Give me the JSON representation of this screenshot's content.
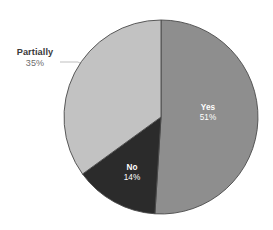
{
  "chart_data": {
    "type": "pie",
    "title": "",
    "subtitle": "",
    "xlabel": "",
    "ylabel": "",
    "grid": false,
    "legend_position": "none",
    "labels_on_slices": true,
    "start_angle_deg": 0,
    "direction": "clockwise",
    "categories": [
      "Yes",
      "Partially",
      "No"
    ],
    "values": [
      51,
      35,
      14
    ],
    "value_unit": "%",
    "slices": [
      {
        "label": "Yes",
        "value": 51,
        "value_text": "51%",
        "color": "#8e8e8e",
        "label_placement": "inside",
        "label_color": "#ffffff",
        "start_angle_deg": 0,
        "end_angle_deg": 183.6
      },
      {
        "label": "No",
        "value": 14,
        "value_text": "14%",
        "color": "#2b2b2b",
        "label_placement": "inside",
        "label_color": "#ffffff",
        "start_angle_deg": 183.6,
        "end_angle_deg": 234.0
      },
      {
        "label": "Partially",
        "value": 35,
        "value_text": "35%",
        "color": "#c2c2c2",
        "label_placement": "outside",
        "label_color": "#3a3a3a",
        "start_angle_deg": 234.0,
        "end_angle_deg": 360.0
      }
    ]
  },
  "figure": {
    "background_color": "#ffffff",
    "outline_color": "#4a4a4a",
    "leader_line_color": "#b8b8b8"
  }
}
